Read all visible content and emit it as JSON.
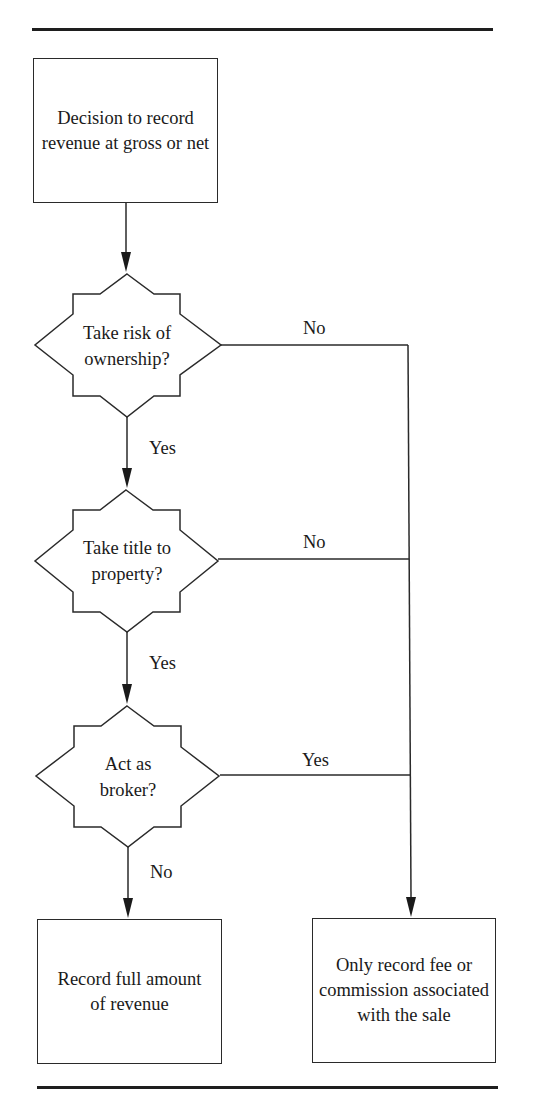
{
  "diagram": {
    "type": "flowchart",
    "start": {
      "id": "start",
      "label": "Decision to record revenue at gross or net"
    },
    "decisions": [
      {
        "id": "d1",
        "label": "Take risk of ownership?",
        "down_label": "Yes",
        "right_label": "No"
      },
      {
        "id": "d2",
        "label": "Take title to property?",
        "down_label": "Yes",
        "right_label": "No"
      },
      {
        "id": "d3",
        "label": "Act as broker?",
        "down_label": "No",
        "right_label": "Yes"
      }
    ],
    "outcomes": {
      "gross": {
        "id": "gross",
        "label": "Record full amount of revenue"
      },
      "net": {
        "id": "net",
        "label": "Only record fee or commission associated with the sale"
      }
    },
    "edges": [
      {
        "from": "start",
        "to": "d1",
        "label": ""
      },
      {
        "from": "d1",
        "to": "d2",
        "label": "Yes"
      },
      {
        "from": "d1",
        "to": "net",
        "label": "No"
      },
      {
        "from": "d2",
        "to": "d3",
        "label": "Yes"
      },
      {
        "from": "d2",
        "to": "net",
        "label": "No"
      },
      {
        "from": "d3",
        "to": "gross",
        "label": "No"
      },
      {
        "from": "d3",
        "to": "net",
        "label": "Yes"
      }
    ],
    "colors": {
      "line": "#2a2a2a",
      "text": "#1a1a1a",
      "background": "#ffffff"
    }
  }
}
